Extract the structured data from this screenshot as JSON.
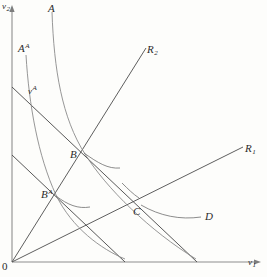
{
  "figure": {
    "title": "",
    "axes": {
      "y_label": "v",
      "y_label_sub": "2",
      "x_label": "v",
      "x_label_sub": "1",
      "origin_label": "0",
      "axis_color": "#8a8a8a"
    },
    "labels": [
      {
        "id": "curve-A",
        "text": "A",
        "sup": "",
        "sub": "",
        "x": 48,
        "y": 4,
        "kind": "curve-label"
      },
      {
        "id": "curve-A-alt",
        "text": "A",
        "sup": "A",
        "sub": "",
        "x": 18,
        "y": 44,
        "kind": "curve-label"
      },
      {
        "id": "budget-v-alt",
        "text": "v",
        "sup": "A",
        "sub": "",
        "x": 28,
        "y": 86,
        "kind": "line-label"
      },
      {
        "id": "ray-R2",
        "text": "R",
        "sup": "",
        "sub": "2",
        "x": 147,
        "y": 45,
        "kind": "ray-label"
      },
      {
        "id": "ray-R1",
        "text": "R",
        "sup": "",
        "sub": "1",
        "x": 245,
        "y": 144,
        "kind": "ray-label"
      },
      {
        "id": "point-B",
        "text": "B",
        "sup": "",
        "sub": "",
        "x": 70,
        "y": 150,
        "kind": "point-label"
      },
      {
        "id": "point-B-alt",
        "text": "B",
        "sup": "A",
        "sub": "",
        "x": 41,
        "y": 190,
        "kind": "point-label"
      },
      {
        "id": "point-C",
        "text": "C",
        "sup": "",
        "sub": "",
        "x": 133,
        "y": 207,
        "kind": "point-label"
      },
      {
        "id": "annot-D",
        "text": "D",
        "sup": "",
        "sub": "",
        "x": 205,
        "y": 212,
        "kind": "annotation-label"
      }
    ],
    "colors": {
      "axis": "#8e8e8e",
      "curve": "#7a7a7a",
      "line": "#4a4a4a",
      "pointer": "#6f6f6f",
      "text": "#2b2b2b",
      "background": "#fdfdfb"
    },
    "geometry": {
      "origin": {
        "x": 12,
        "y": 262
      },
      "y_axis_top": {
        "x": 12,
        "y": 8
      },
      "x_axis_right": {
        "x": 258,
        "y": 262
      },
      "budget_line_high": {
        "x1": 12,
        "y1": 87,
        "x2": 197,
        "y2": 262
      },
      "budget_line_low": {
        "x1": 12,
        "y1": 155,
        "x2": 125,
        "y2": 262
      },
      "ray_R2": {
        "x1": 12,
        "y1": 262,
        "x2": 146,
        "y2": 48
      },
      "ray_R1": {
        "x1": 12,
        "y1": 262,
        "x2": 242,
        "y2": 148
      },
      "curve_A": {
        "start": [
          52,
          12
        ],
        "end": [
          196,
          259
        ]
      },
      "curve_A_alt": {
        "start": [
          26,
          55
        ],
        "end": [
          125,
          259
        ]
      },
      "points": {
        "B": {
          "x": 85,
          "y": 154
        },
        "B_alt": {
          "x": 56,
          "y": 195
        },
        "C": {
          "x": 141,
          "y": 203
        }
      }
    }
  }
}
